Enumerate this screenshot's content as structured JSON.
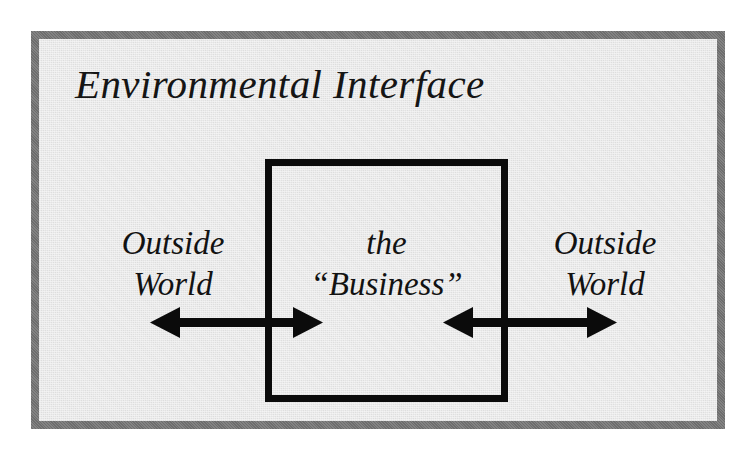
{
  "figure": {
    "kind": "block-diagram",
    "caption_title": "Environmental Interface",
    "background_color": "#e9e9e9",
    "page_color": "#ffffff"
  },
  "frame": {
    "label": "Environmental Interface",
    "border_color": "#6d6d6d",
    "border_width_px": 8,
    "fill_color": "#e9e9e9"
  },
  "center_box": {
    "name": "the-business",
    "line1": "the",
    "line2": "“Business”",
    "border_color": "#0b0b0b",
    "border_width_px": 7
  },
  "left_region": {
    "line1": "Outside",
    "line2": "World"
  },
  "right_region": {
    "line1": "Outside",
    "line2": "World"
  },
  "arrows": {
    "color": "#0b0b0b",
    "left": {
      "name": "left-bidirectional-arrow",
      "direction": "bidirectional",
      "meaning": "exchange between Outside World and the Business across the environmental interface"
    },
    "right": {
      "name": "right-bidirectional-arrow",
      "direction": "bidirectional",
      "meaning": "exchange between the Business and Outside World across the environmental interface"
    }
  }
}
